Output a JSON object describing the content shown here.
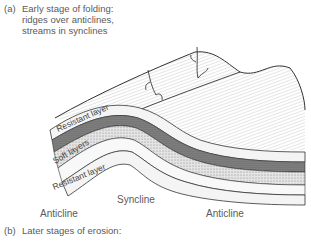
{
  "figure": {
    "panel_a": {
      "marker": "(a)",
      "caption_lines": [
        "Early stage of folding:",
        "ridges over anticlines,",
        "streams in synclines"
      ]
    },
    "panel_b": {
      "marker": "(b)",
      "caption": "Later stages of erosion:"
    },
    "layer_labels": {
      "top_resistant": "Resistant layer",
      "soft": "Soft layers",
      "bottom_resistant": "Resistant layer"
    },
    "structure_labels": {
      "anticline_left": "Anticline",
      "syncline": "Syncline",
      "anticline_right": "Anticline"
    }
  }
}
